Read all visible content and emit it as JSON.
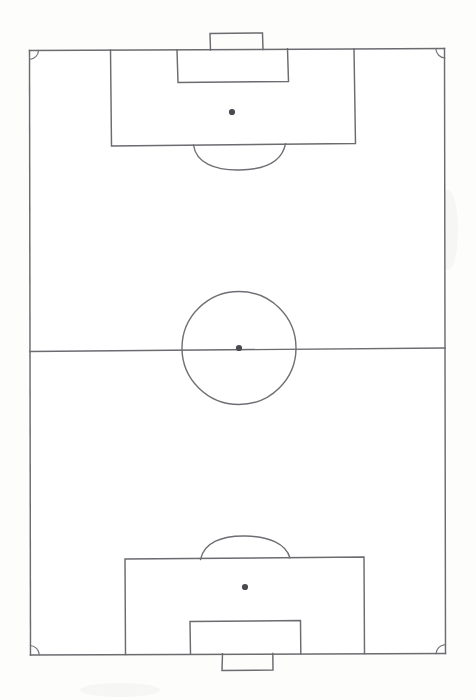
{
  "document": {
    "title": "Football Pitch Diagram",
    "subject": "association-football-pitch",
    "orientation": "portrait",
    "medium": "hand-drawn pencil line drawing on white paper",
    "text_labels": [],
    "background_color": "#ffffff",
    "line_color": "#6b6b70",
    "spot_color": "#4a4a50"
  },
  "chart_data": {
    "type": "diagram",
    "title": "Football Pitch Diagram",
    "coordinate_space": {
      "width": 476,
      "height": 700
    },
    "units": "pixels",
    "elements": [
      {
        "name": "pitch-boundary",
        "shape": "rectangle",
        "x": 29,
        "y": 50,
        "width": 416,
        "height": 603,
        "description": "outer touchlines and goal lines"
      },
      {
        "name": "halfway-line",
        "shape": "line",
        "x1": 29,
        "y1": 350,
        "x2": 445,
        "y2": 350,
        "description": "halfway line dividing the pitch"
      },
      {
        "name": "centre-circle",
        "shape": "circle",
        "cx": 239,
        "cy": 348,
        "r": 57,
        "description": "centre circle"
      },
      {
        "name": "centre-spot",
        "shape": "dot",
        "cx": 239,
        "cy": 348,
        "r": 3.1,
        "description": "centre mark"
      },
      {
        "name": "top-penalty-area",
        "shape": "rectangle",
        "x": 110,
        "y": 50,
        "width": 245,
        "height": 96,
        "description": "upper 18-yard penalty area"
      },
      {
        "name": "top-goal-area",
        "shape": "rectangle",
        "x": 177,
        "y": 50,
        "width": 111,
        "height": 32,
        "description": "upper 6-yard goal area"
      },
      {
        "name": "top-goal",
        "shape": "rectangle",
        "x": 210,
        "y": 33,
        "width": 53,
        "height": 17,
        "description": "upper goal / net box outside goal line"
      },
      {
        "name": "top-penalty-spot",
        "shape": "dot",
        "cx": 232,
        "cy": 112,
        "r": 3.1,
        "description": "upper penalty mark"
      },
      {
        "name": "top-penalty-arc",
        "shape": "arc",
        "cx": 239,
        "cy": 131,
        "rx": 46,
        "ry": 36,
        "direction": "bulging-away-from-goal",
        "description": "upper penalty arc (D)"
      },
      {
        "name": "bottom-penalty-area",
        "shape": "rectangle",
        "x": 125,
        "y": 558,
        "width": 239,
        "height": 95,
        "description": "lower 18-yard penalty area"
      },
      {
        "name": "bottom-goal-area",
        "shape": "rectangle",
        "x": 190,
        "y": 621,
        "width": 110,
        "height": 32,
        "description": "lower 6-yard goal area"
      },
      {
        "name": "bottom-goal",
        "shape": "rectangle",
        "x": 222,
        "y": 653,
        "width": 51,
        "height": 17,
        "description": "lower goal / net box outside goal line"
      },
      {
        "name": "bottom-penalty-spot",
        "shape": "dot",
        "cx": 245,
        "cy": 587,
        "r": 3.1,
        "description": "lower penalty mark"
      },
      {
        "name": "bottom-penalty-arc",
        "shape": "arc",
        "cx": 245,
        "cy": 573,
        "rx": 45,
        "ry": 36,
        "direction": "bulging-away-from-goal",
        "description": "lower penalty arc (D)"
      },
      {
        "name": "corner-arc-top-left",
        "shape": "quarter-arc",
        "cx": 29,
        "cy": 50,
        "r": 9,
        "description": "top-left corner arc"
      },
      {
        "name": "corner-arc-top-right",
        "shape": "quarter-arc",
        "cx": 445,
        "cy": 50,
        "r": 9,
        "description": "top-right corner arc"
      },
      {
        "name": "corner-arc-bottom-left",
        "shape": "quarter-arc",
        "cx": 29,
        "cy": 653,
        "r": 9,
        "description": "bottom-left corner arc"
      },
      {
        "name": "corner-arc-bottom-right",
        "shape": "quarter-arc",
        "cx": 445,
        "cy": 653,
        "r": 9,
        "description": "bottom-right corner arc"
      }
    ]
  }
}
